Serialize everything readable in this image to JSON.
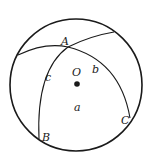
{
  "figure": {
    "type": "spherical-triangle",
    "center_label": "O",
    "vertices": {
      "A": "A",
      "B": "B",
      "C": "C"
    },
    "sides": {
      "a": "a",
      "b": "b",
      "c": "c"
    },
    "colors": {
      "stroke": "#1a1a1a",
      "background": "#ffffff"
    }
  }
}
